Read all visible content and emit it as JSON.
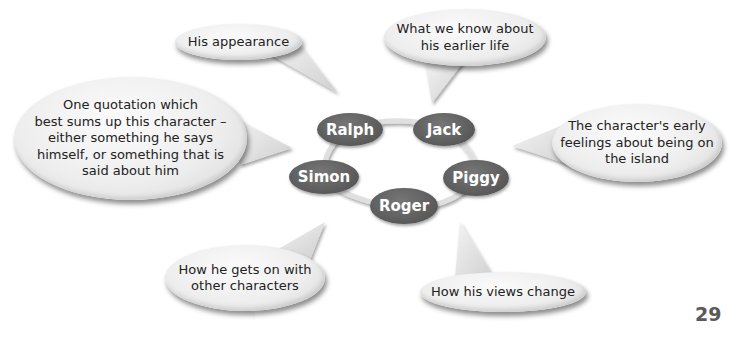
{
  "diagram": {
    "title": "",
    "colors": {
      "node_fill": "#5f5f5f",
      "node_text": "#ffffff",
      "bubble_fill": "#eeeeee",
      "bubble_text": "#222222",
      "ring": "#e2e2e2"
    },
    "characters": [
      {
        "name": "Ralph"
      },
      {
        "name": "Jack"
      },
      {
        "name": "Piggy"
      },
      {
        "name": "Roger"
      },
      {
        "name": "Simon"
      }
    ],
    "prompts": [
      {
        "id": "appearance",
        "text": "His appearance"
      },
      {
        "id": "earlier-life",
        "text": "What we know about\nhis earlier life"
      },
      {
        "id": "early-feelings",
        "text": "The character's early\nfeelings about being on\nthe island"
      },
      {
        "id": "views-change",
        "text": "How his views change"
      },
      {
        "id": "relationships",
        "text": "How he gets on with\nother characters"
      },
      {
        "id": "quotation",
        "text": "One quotation which\nbest sums up this character –\neither something he says\nhimself, or something that is\nsaid about him"
      }
    ]
  },
  "page": {
    "number": "29"
  }
}
